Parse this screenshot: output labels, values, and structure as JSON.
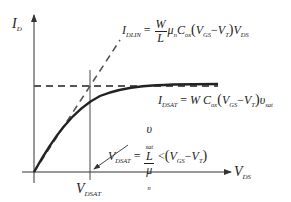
{
  "diagram": {
    "axes": {
      "y_label_main": "I",
      "y_label_sub": "D",
      "x_label_main": "V",
      "x_label_sub": "DS"
    },
    "marker": {
      "label_main": "V",
      "label_sub": "DSAT"
    },
    "equations": {
      "idlin": {
        "lhs_main": "I",
        "lhs_sub": "DLIN",
        "eq": "=",
        "frac_num": "W",
        "frac_den": "L",
        "mu": "μ",
        "mu_sub": "n",
        "c": "C",
        "c_sub": "ox",
        "paren_open": "(",
        "vgs": "V",
        "vgs_sub": "GS",
        "minus": "−",
        "vt": "V",
        "vt_sub": "T",
        "paren_close": ")",
        "vds": "V",
        "vds_sub": "DS"
      },
      "idsat": {
        "lhs_main": "I",
        "lhs_sub": "DSAT",
        "eq": "=",
        "w": "W",
        "c": "C",
        "c_sub": "ox",
        "paren_open": "(",
        "vgs": "V",
        "vgs_sub": "GS",
        "minus": "−",
        "vt": "V",
        "vt_sub": "T",
        "paren_close": ")",
        "v": "υ",
        "v_sub": "sat"
      },
      "vdsat": {
        "lhs_main": "V",
        "lhs_sub": "DSAT",
        "eq": "=",
        "num_v": "υ",
        "num_v_sub": "sat",
        "num_l": "L",
        "den_mu": "μ",
        "den_mu_sub": "n",
        "lt": "<",
        "paren_open": "(",
        "vgs": "V",
        "vgs_sub": "GS",
        "minus": "−",
        "vt": "V",
        "vt_sub": "T",
        "paren_close": ")"
      }
    },
    "colors": {
      "line": "#222222",
      "dashed": "#555555",
      "background": "#ffffff"
    }
  }
}
